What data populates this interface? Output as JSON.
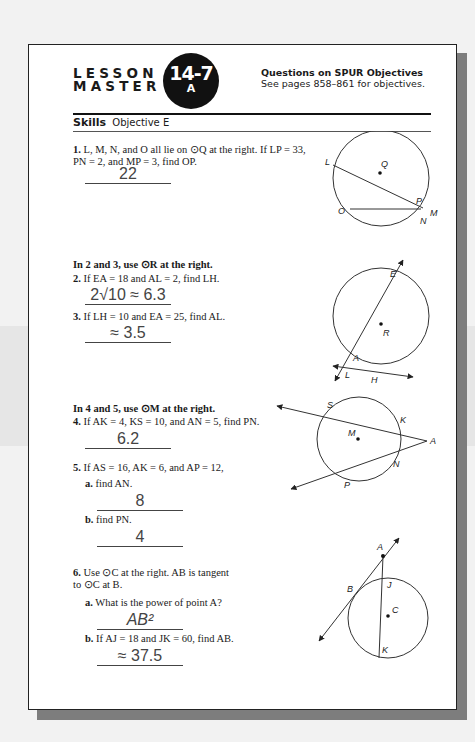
{
  "header": {
    "lesson_line1": "LESSON",
    "lesson_line2": "MASTER",
    "badge_number": "14-7",
    "badge_letter": "A",
    "spur_title": "Questions on SPUR Objectives",
    "spur_subtitle": "See pages 858–861 for objectives."
  },
  "skills": {
    "label": "Skills",
    "objective": "Objective E"
  },
  "questions": [
    {
      "num": "1.",
      "text": "L, M, N, and O all lie on ⊙Q at the right. If LP = 33, PN = 2, and MP = 3, find OP.",
      "answer": "22"
    },
    {
      "section": "In 2 and 3, use ⊙R at the right."
    },
    {
      "num": "2.",
      "text": "If EA = 18 and AL = 2, find LH.",
      "answer": "2√10 ≈ 6.3"
    },
    {
      "num": "3.",
      "text": "If LH = 10 and EA = 25, find AL.",
      "answer": "≈ 3.5"
    },
    {
      "section": "In 4 and 5, use ⊙M at the right."
    },
    {
      "num": "4.",
      "text": "If AK = 4, KS = 10, and AN = 5, find PN.",
      "answer": "6.2"
    },
    {
      "num": "5.",
      "text": "If AS = 16, AK = 6, and AP = 12,",
      "parts": [
        {
          "label": "a.",
          "text": "find AN.",
          "answer": "8"
        },
        {
          "label": "b.",
          "text": "find PN.",
          "answer": "4"
        }
      ]
    },
    {
      "num": "6.",
      "text": "Use ⊙C at the right. AB is tangent to ⊙C at B.",
      "parts": [
        {
          "label": "a.",
          "text": "What is the power of point A?",
          "answer": "AB²"
        },
        {
          "label": "b.",
          "text": "If AJ = 18 and JK = 60, find AB.",
          "answer": "≈ 37.5"
        }
      ]
    }
  ],
  "diagrams": {
    "circle_q": {
      "labels": [
        "L",
        "Q",
        "P",
        "O",
        "M",
        "N"
      ]
    },
    "circle_r": {
      "labels": [
        "E",
        "R",
        "A",
        "L",
        "H"
      ]
    },
    "circle_m": {
      "labels": [
        "S",
        "K",
        "M",
        "A",
        "N",
        "P"
      ]
    },
    "circle_c": {
      "labels": [
        "A",
        "B",
        "J",
        "C",
        "K"
      ]
    }
  }
}
